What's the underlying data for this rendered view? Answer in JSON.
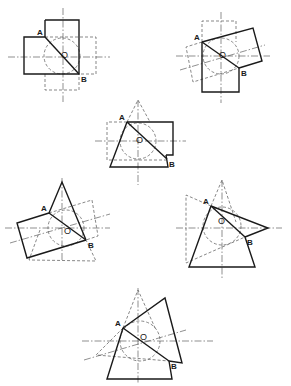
{
  "figure": {
    "label_a": "A",
    "label_b": "B",
    "label_o": "O"
  },
  "diagrams": [
    {
      "name": "square-square-right-angle",
      "a": [
        45,
        37
      ],
      "b": [
        79,
        74
      ],
      "o": [
        63,
        56
      ],
      "axes": {
        "v": [
          63,
          8,
          102
        ],
        "h": [
          57,
          8,
          110
        ]
      },
      "circle": {
        "cx": 62,
        "cy": 56,
        "r": 18
      },
      "solid": [
        "45,20 79,20 79,74 24,74 24,37 45,37 45,20"
      ],
      "diagonal": true,
      "dashed": [
        "45,37 96,37 96,74 79,74",
        "45,74 45,90 79,90 79,74"
      ],
      "center_extra": []
    },
    {
      "name": "square-square-oblique",
      "a": [
        202,
        42
      ],
      "b": [
        239,
        68
      ],
      "o": [
        221,
        56
      ],
      "axes": {
        "v": [
          221,
          12,
          103
        ],
        "h": [
          56,
          176,
          270
        ]
      },
      "circle": {
        "cx": 221,
        "cy": 56,
        "r": 18
      },
      "solid": [
        "202,42 253,28 262,61 239,68",
        "202,42 202,92 239,92 239,68"
      ],
      "diagonal": true,
      "dashed": [
        "202,42 202,21 236,21 236,42",
        "202,42 186,47 193,82 239,68"
      ],
      "center_extra": [
        "180,70 265,45"
      ]
    },
    {
      "name": "cone-square",
      "a": [
        127,
        122
      ],
      "b": [
        167,
        159
      ],
      "o": [
        138,
        141
      ],
      "axes": {
        "v": [
          138,
          100,
          185
        ],
        "h": [
          141,
          95,
          186
        ]
      },
      "circle": {
        "cx": 138,
        "cy": 141,
        "r": 18
      },
      "solid": [
        "127,122 173,122 173,155 166,155",
        "127,122 110,167 168,167 166,155"
      ],
      "diagonal": true,
      "dashed": [
        "127,122 107,122 107,160 166,160",
        "127,122 138,100 150,122"
      ],
      "center_extra": []
    },
    {
      "name": "cone-prism-oblique",
      "a": [
        49,
        213
      ],
      "b": [
        86,
        240
      ],
      "o": [
        66,
        232
      ],
      "axes": {
        "v": [
          62,
          178,
          262
        ],
        "h": [
          228,
          5,
          110
        ]
      },
      "circle": {
        "cx": 66,
        "cy": 228,
        "r": 18
      },
      "solid": [
        "49,213 17,223 27,258 86,240",
        "49,213 62,182 86,240"
      ],
      "diagonal": true,
      "dashed": [
        "49,213 92,200 98,236 86,240",
        "40,230 29,260 96,261 86,240"
      ],
      "center_extra": [
        "10,243 110,214"
      ]
    },
    {
      "name": "cone-cone",
      "a": [
        211,
        206
      ],
      "b": [
        245,
        237
      ],
      "o": [
        220,
        222
      ],
      "axes": {
        "v": [
          222,
          180,
          278
        ],
        "h": [
          228,
          176,
          282
        ]
      },
      "circle": {
        "cx": 222,
        "cy": 226,
        "r": 19
      },
      "solid": [
        "211,206 268,228 245,237",
        "211,206 189,267 255,267 245,237"
      ],
      "diagonal": true,
      "dashed": [
        "211,206 186,195 186,263 245,237",
        "211,206 222,180 236,222"
      ],
      "center_extra": []
    },
    {
      "name": "cone-prism-oblique-2",
      "a": [
        123,
        328
      ],
      "b": [
        169,
        361
      ],
      "o": [
        142,
        338
      ],
      "axes": {
        "v": [
          138,
          288,
          384
        ],
        "h": [
          341,
          82,
          213
        ]
      },
      "circle": {
        "cx": 140,
        "cy": 341,
        "r": 20
      },
      "solid": [
        "123,328 165,298 182,363 169,361",
        "123,328 107,379 172,379 169,361"
      ],
      "diagonal": true,
      "dashed": [
        "123,328 138,290 156,330",
        "123,328 96,355 169,361"
      ],
      "center_extra": [
        "84,360 186,330"
      ]
    }
  ]
}
